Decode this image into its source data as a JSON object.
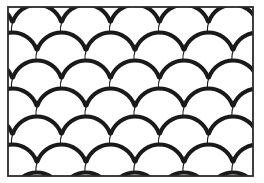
{
  "figure": {
    "name": "fish-scale-pattern",
    "canvas": {
      "width": 264,
      "height": 183
    },
    "colors": {
      "background": "#ffffff",
      "ink": "#1a1a1a",
      "frame": "#2b2b2b",
      "fill": "#ffffff"
    }
  },
  "frame": {
    "name": "border-rectangle",
    "x": 8,
    "y": 7,
    "width": 245,
    "height": 169,
    "stroke_width": 1.8,
    "stroke": "#2b2b2b",
    "fill": "#ffffff"
  },
  "pattern": {
    "type": "imbrication-scallop",
    "scale_pitch_x": 49,
    "scale_pitch_y": 28,
    "row_offset_x": 24.5,
    "radius": 25.5,
    "columns": 7,
    "rows": 8,
    "origin_x": -12,
    "origin_y": 2,
    "thick_stroke_width": 4.2,
    "thin_stroke_width": 1.1,
    "thick_arc_start_deg": 200,
    "thick_arc_end_deg": 340,
    "thin_arc_start_deg": 340,
    "thin_arc_end_deg": 560,
    "ink": "#1a1a1a"
  },
  "rows": [
    {
      "index": 0,
      "offset": 0,
      "y": 2
    },
    {
      "index": 1,
      "offset": 24.5,
      "y": 30
    },
    {
      "index": 2,
      "offset": 0,
      "y": 58
    },
    {
      "index": 3,
      "offset": 24.5,
      "y": 86
    },
    {
      "index": 4,
      "offset": 0,
      "y": 114
    },
    {
      "index": 5,
      "offset": 24.5,
      "y": 142
    },
    {
      "index": 6,
      "offset": 0,
      "y": 170
    },
    {
      "index": 7,
      "offset": 24.5,
      "y": 198
    }
  ]
}
